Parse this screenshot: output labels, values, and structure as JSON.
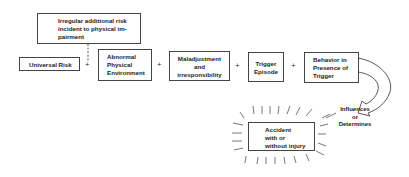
{
  "diagram": {
    "top_box": {
      "lines": [
        "Irregular additional risk",
        "incident to physical im-",
        "pairment"
      ]
    },
    "chain": [
      {
        "id": "universal-risk",
        "lines": [
          "Universal Risk"
        ]
      },
      {
        "id": "abnormal-physical-environment",
        "lines": [
          "Abnormal",
          "Physical",
          "Environment"
        ]
      },
      {
        "id": "maladjustment-and-irresponsibility",
        "lines": [
          "Maladjustment",
          "and",
          "irresponsibility"
        ]
      },
      {
        "id": "trigger-episode",
        "lines": [
          "Trigger",
          "Episode"
        ]
      },
      {
        "id": "behavior-in-presence-of-trigger",
        "lines": [
          "Behavior in",
          "Presence of",
          "Trigger"
        ]
      }
    ],
    "operator": "+",
    "outcome_box": {
      "lines": [
        "Accident",
        "with or",
        "without injury"
      ]
    },
    "arrow_label": {
      "lines": [
        "Influences",
        "or",
        "Determines"
      ]
    },
    "colors": {
      "line": "#444444",
      "text": "#222222",
      "background": "#ffffff"
    }
  }
}
